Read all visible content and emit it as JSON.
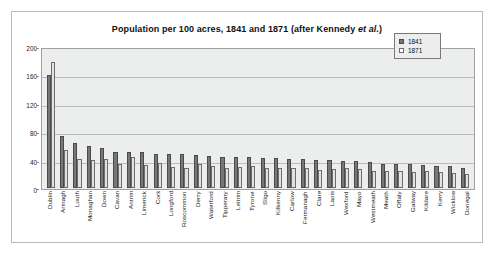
{
  "chart_data": {
    "type": "bar",
    "title": "Population per 100 acres, 1841 and 1871 (after Kennedy et al.)",
    "title_plain": "Population per 100 acres, 1841 and 1871 (after Kennedy ",
    "title_italic": "et al.",
    "title_tail": ")",
    "xlabel": "",
    "ylabel": "",
    "ylim": [
      0,
      200
    ],
    "yticks": [
      0,
      40,
      80,
      120,
      160,
      200
    ],
    "ytick_labels": [
      "0",
      "40",
      "80",
      "120",
      "160",
      "200"
    ],
    "grid": true,
    "legend_position": "top-right",
    "categories": [
      "Dublin",
      "Armagh",
      "Louth",
      "Monaghan",
      "Down",
      "Cavan",
      "Antrim",
      "Limerick",
      "Cork",
      "Longford",
      "Roscommon",
      "Derry",
      "Waterford",
      "Tipperary",
      "Leitrim",
      "Tyrone",
      "Sligo",
      "Kilkenny",
      "Carlow",
      "Fermanagh",
      "Clare",
      "Laois",
      "Wexford",
      "Mayo",
      "Westmeath",
      "Meath",
      "Offaly",
      "Galway",
      "Kildare",
      "Kerry",
      "Wicklow",
      "Donegal"
    ],
    "series": [
      {
        "name": "1841",
        "color": "#777777",
        "values": [
          162,
          74,
          64,
          60,
          57,
          52,
          52,
          51,
          49,
          49,
          48,
          47,
          46,
          45,
          45,
          44,
          43,
          43,
          42,
          41,
          40,
          40,
          39,
          38,
          37,
          35,
          34,
          34,
          33,
          32,
          31,
          28
        ]
      },
      {
        "name": "1871",
        "color": "#e2e2e2",
        "values": [
          180,
          54,
          41,
          40,
          42,
          35,
          45,
          33,
          36,
          30,
          29,
          35,
          32,
          29,
          30,
          31,
          29,
          29,
          29,
          29,
          26,
          27,
          28,
          27,
          25,
          24,
          24,
          23,
          24,
          23,
          22,
          20
        ]
      }
    ]
  },
  "legend": {
    "items": [
      {
        "label": "1841"
      },
      {
        "label": "1871"
      }
    ]
  }
}
